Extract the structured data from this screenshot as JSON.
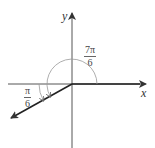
{
  "diagram": {
    "axes": {
      "x_label": "x",
      "y_label": "y"
    },
    "angles": [
      {
        "name": "angle-7pi-6",
        "numerator": "7π",
        "denominator": "6"
      },
      {
        "name": "reference-angle-pi-6",
        "numerator": "π",
        "denominator": "6"
      }
    ],
    "colors": {
      "axis": "#333333",
      "arc": "#888888",
      "ray": "#222222"
    }
  }
}
